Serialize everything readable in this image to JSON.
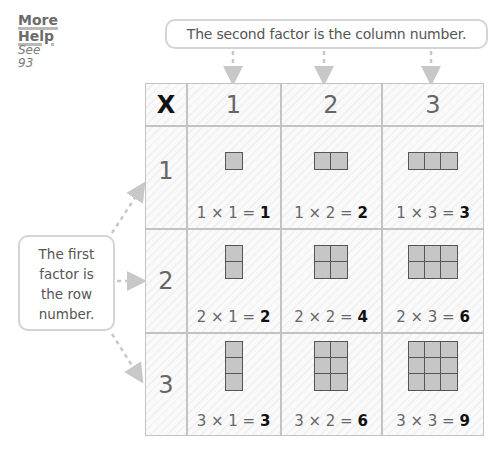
{
  "more_help": {
    "line1": "More",
    "line2": "Help",
    "see_label": "See",
    "page": "93"
  },
  "callouts": {
    "column": "The second factor is the column number.",
    "row_lines": [
      "The first",
      "factor is",
      "the row",
      "number."
    ]
  },
  "table": {
    "operator": "X",
    "column_headers": [
      "1",
      "2",
      "3"
    ],
    "row_headers": [
      "1",
      "2",
      "3"
    ],
    "cells": [
      [
        {
          "rows": 1,
          "cols": 1,
          "expr": "1 × 1 = ",
          "product": "1"
        },
        {
          "rows": 1,
          "cols": 2,
          "expr": "1 × 2 = ",
          "product": "2"
        },
        {
          "rows": 1,
          "cols": 3,
          "expr": "1 × 3 = ",
          "product": "3"
        }
      ],
      [
        {
          "rows": 2,
          "cols": 1,
          "expr": "2 × 1 = ",
          "product": "2"
        },
        {
          "rows": 2,
          "cols": 2,
          "expr": "2 × 2 = ",
          "product": "4"
        },
        {
          "rows": 2,
          "cols": 3,
          "expr": "2 × 3 = ",
          "product": "6"
        }
      ],
      [
        {
          "rows": 3,
          "cols": 1,
          "expr": "3 × 1 = ",
          "product": "3"
        },
        {
          "rows": 3,
          "cols": 2,
          "expr": "3 × 2 = ",
          "product": "6"
        },
        {
          "rows": 3,
          "cols": 3,
          "expr": "3 × 3 = ",
          "product": "9"
        }
      ]
    ]
  },
  "colors": {
    "border": "#c3c3c3",
    "square_fill": "#c6c6c6",
    "square_stroke": "#555555",
    "arrow": "#c8c8c8"
  }
}
